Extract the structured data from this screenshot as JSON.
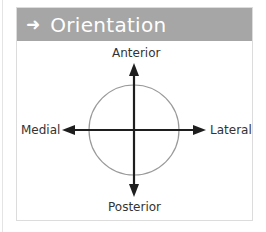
{
  "header": {
    "icon": "arrow-right-icon",
    "icon_glyph": "➜",
    "title": "Orientation",
    "background": "#a6a6a6"
  },
  "diagram": {
    "labels": {
      "top": "Anterior",
      "bottom": "Posterior",
      "left": "Medial",
      "right": "Lateral"
    },
    "circle_color": "#9a9a9a",
    "arrow_color": "#1e1e1e"
  }
}
